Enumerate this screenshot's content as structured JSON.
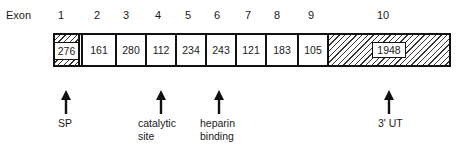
{
  "diagram": {
    "header_label": "Exon",
    "exons": [
      {
        "number": "1",
        "size": "276",
        "fill": "partial-hatch"
      },
      {
        "number": "2",
        "size": "161",
        "fill": "white"
      },
      {
        "number": "3",
        "size": "280",
        "fill": "white"
      },
      {
        "number": "4",
        "size": "112",
        "fill": "white"
      },
      {
        "number": "5",
        "size": "234",
        "fill": "white"
      },
      {
        "number": "6",
        "size": "243",
        "fill": "white"
      },
      {
        "number": "7",
        "size": "121",
        "fill": "white"
      },
      {
        "number": "8",
        "size": "183",
        "fill": "white"
      },
      {
        "number": "9",
        "size": "105",
        "fill": "white"
      },
      {
        "number": "10",
        "size": "1948",
        "fill": "hatched"
      }
    ],
    "annotations": [
      {
        "label_lines": [
          "SP"
        ],
        "exon": "1"
      },
      {
        "label_lines": [
          "catalytic",
          "site"
        ],
        "exon": "4"
      },
      {
        "label_lines": [
          "heparin",
          "binding"
        ],
        "exon": "6"
      },
      {
        "label_lines": [
          "3' UT"
        ],
        "exon": "10"
      }
    ],
    "colors": {
      "line": "#111111",
      "background": "#ffffff",
      "hatch": "#333333"
    }
  }
}
